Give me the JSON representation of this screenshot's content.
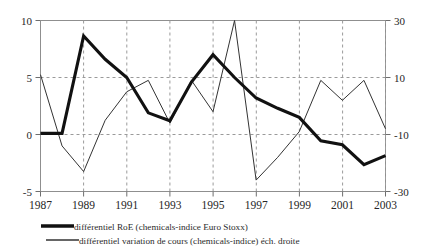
{
  "chart_data": {
    "type": "line",
    "title": "",
    "subtitle": "",
    "xlabel": "",
    "ylabel": "",
    "grid": "vertical dashed at odd years, horizontal dashed at 5, 0",
    "legend_position": "below-chart-left",
    "x": [
      1987,
      1988,
      1989,
      1990,
      1991,
      1992,
      1993,
      1994,
      1995,
      1996,
      1997,
      1998,
      1999,
      2000,
      2001,
      2002,
      2003
    ],
    "xtick_labels": [
      "1987",
      "1989",
      "1991",
      "1993",
      "1995",
      "1997",
      "1999",
      "2001",
      "2003"
    ],
    "xtick_values": [
      1987,
      1989,
      1991,
      1993,
      1995,
      1997,
      1999,
      2001,
      2003
    ],
    "xlim": [
      1987,
      2003
    ],
    "left_axis": {
      "ylim": [
        -5,
        10
      ],
      "ytick_labels": [
        "10",
        "5",
        "0",
        "-5"
      ],
      "ytick_values": [
        10,
        5,
        0,
        -5
      ]
    },
    "right_axis": {
      "ylim": [
        -30,
        30
      ],
      "ytick_labels": [
        "30",
        "10",
        "-10",
        "-30"
      ],
      "ytick_values": [
        30,
        10,
        -10,
        -30
      ]
    },
    "series": [
      {
        "name": "différentiel RoE (chemicals-indice Euro Stoxx)",
        "axis": "left",
        "style": "thick",
        "color": "#111111",
        "values": [
          0.1,
          0.1,
          8.65,
          6.6,
          5.0,
          1.9,
          1.2,
          4.6,
          7.0,
          5.0,
          3.2,
          2.3,
          1.5,
          -0.55,
          -0.9,
          -2.65,
          -1.85
        ]
      },
      {
        "name": "différentiel variation de cours (chemicals-indice) éch. droite",
        "axis": "right",
        "style": "thin",
        "color": "#333333",
        "values": [
          11,
          -14,
          -23,
          -5,
          5,
          9,
          -6,
          9,
          -2,
          30,
          -26,
          -18,
          -9,
          9,
          2,
          9,
          -8
        ]
      }
    ]
  },
  "legend": {
    "items": [
      {
        "label": "différentiel RoE (chemicals-indice Euro Stoxx)",
        "style": "thick"
      },
      {
        "label": "différentiel variation de cours (chemicals-indice) éch. droite",
        "style": "thin"
      }
    ]
  },
  "axes": {
    "left_ticks": [
      "10",
      "5",
      "0",
      "-5"
    ],
    "right_ticks": [
      "30",
      "10",
      "-10",
      "-30"
    ],
    "x_ticks": [
      "1987",
      "1989",
      "1991",
      "1993",
      "1995",
      "1997",
      "1999",
      "2001",
      "2003"
    ]
  }
}
